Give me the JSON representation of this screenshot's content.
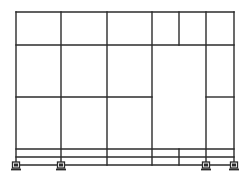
{
  "diagram": {
    "type": "structural-frame-elevation",
    "colors": {
      "line": "#2b2b2b",
      "background": "#ffffff"
    },
    "frame": {
      "left": 16,
      "right": 234,
      "top": 12,
      "bottom": 165
    },
    "columns": [
      {
        "id": "col-1",
        "x": 16,
        "y1": 12,
        "y2": 165
      },
      {
        "id": "col-2",
        "x": 61,
        "y1": 12,
        "y2": 165
      },
      {
        "id": "col-3",
        "x": 107,
        "y1": 12,
        "y2": 165
      },
      {
        "id": "col-4",
        "x": 152,
        "y1": 12,
        "y2": 165
      },
      {
        "id": "col-5-top",
        "x": 179,
        "y1": 12,
        "y2": 45
      },
      {
        "id": "col-5-bottom",
        "x": 179,
        "y1": 149,
        "y2": 165
      },
      {
        "id": "col-6",
        "x": 206,
        "y1": 12,
        "y2": 165
      },
      {
        "id": "col-7",
        "x": 234,
        "y1": 12,
        "y2": 165
      }
    ],
    "beams": [
      {
        "id": "beam-roof",
        "y": 12,
        "x1": 16,
        "x2": 234
      },
      {
        "id": "beam-level-2",
        "y": 45,
        "x1": 16,
        "x2": 234
      },
      {
        "id": "beam-level-1-left",
        "y": 97,
        "x1": 16,
        "x2": 152
      },
      {
        "id": "beam-level-1-right",
        "y": 97,
        "x1": 206,
        "x2": 234
      },
      {
        "id": "beam-plinth-upper",
        "y": 149,
        "x1": 16,
        "x2": 234
      },
      {
        "id": "beam-plinth-middle",
        "y": 157,
        "x1": 16,
        "x2": 234
      },
      {
        "id": "beam-base",
        "y": 165,
        "x1": 16,
        "x2": 234
      }
    ],
    "supports": [
      {
        "id": "support-1",
        "x": 16,
        "y": 165,
        "kind": "fixed"
      },
      {
        "id": "support-2",
        "x": 61,
        "y": 165,
        "kind": "fixed"
      },
      {
        "id": "support-3",
        "x": 206,
        "y": 165,
        "kind": "fixed"
      },
      {
        "id": "support-4",
        "x": 234,
        "y": 165,
        "kind": "fixed"
      }
    ]
  }
}
